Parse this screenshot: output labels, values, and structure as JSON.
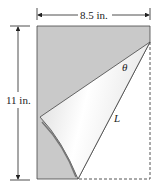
{
  "diagram": {
    "type": "folded-paper-geometry",
    "width_label": "8.5 in.",
    "height_label": "11 in.",
    "angle_label": "θ",
    "length_label": "L",
    "colors": {
      "paper_back": "#c9c9c9",
      "paper_fold": "#ededed",
      "line": "#333333",
      "dashed": "#555555"
    }
  }
}
